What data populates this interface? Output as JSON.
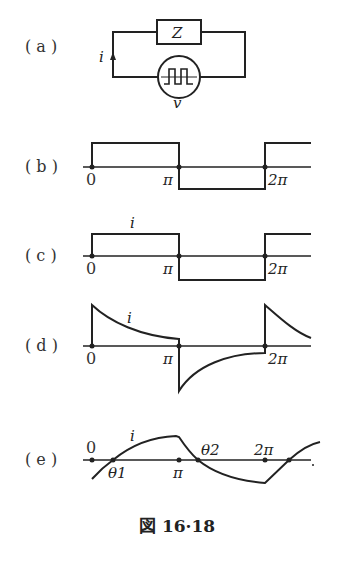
{
  "figure": {
    "caption": "図 16·18",
    "panels": {
      "a": {
        "label": "( a )",
        "impedance_label": "Z",
        "current_label": "i",
        "source_label": "v"
      },
      "b": {
        "label": "( b )",
        "ticks": [
          "0",
          "π",
          "2π"
        ]
      },
      "c": {
        "label": "( c )",
        "ticks": [
          "0",
          "π",
          "2π"
        ],
        "curve_label": "i"
      },
      "d": {
        "label": "( d )",
        "ticks": [
          "0",
          "π",
          "2π"
        ],
        "curve_label": "i"
      },
      "e": {
        "label": "( e )",
        "ticks": [
          "0",
          "π",
          "2π"
        ],
        "curve_label": "i",
        "theta1": "θ1",
        "theta2": "θ2"
      }
    }
  }
}
